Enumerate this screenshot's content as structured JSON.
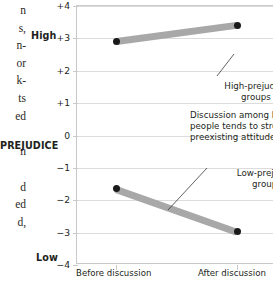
{
  "page_text_fragments": [
    "n",
    "s,",
    "n-",
    "or",
    "k-",
    "ts",
    "ed",
    "n",
    "d",
    "ed",
    "d,"
  ],
  "axis_titles": {
    "y_axis": "PREJUDICE",
    "y_high": "High",
    "y_low": "Low"
  },
  "chart_data": {
    "type": "line",
    "title": "",
    "xlabel": "",
    "ylabel": "PREJUDICE",
    "x": [
      "Before discussion",
      "After discussion"
    ],
    "categories": [
      "Before discussion",
      "After discussion"
    ],
    "ylim": [
      -4,
      4
    ],
    "yticks": [
      "+4",
      "+3",
      "+2",
      "+1",
      "0",
      "-1",
      "-2",
      "-3",
      "-4"
    ],
    "ytick_values": [
      4,
      3,
      2,
      1,
      0,
      -1,
      -2,
      -3,
      -4
    ],
    "y_axis_high_label": "High",
    "y_axis_low_label": "Low",
    "grid": true,
    "legend": "annotations",
    "series": [
      {
        "name": "High-prejudice groups",
        "values": [
          2.9,
          3.4
        ]
      },
      {
        "name": "Low-prejudice groups",
        "values": [
          -1.65,
          -2.97
        ]
      }
    ],
    "annotations": [
      "High-prejudice\ngroups",
      "Low-prejudice\ngroups",
      "Discussion among like-minded people tends to strengthen preexisting attitudes"
    ],
    "colors": {
      "line": "#a8a8a8",
      "point": "#1a1a1a",
      "grid": "#dcdcdc",
      "axis": "#c9c9c9",
      "text": "#231f20"
    }
  },
  "annotations": {
    "high_label": "High-prejudice\ngroups",
    "low_label": "Low-prejudice\ngroups",
    "body": "Discussion among like-minded people tends to strengthen preexisting attitudes"
  }
}
